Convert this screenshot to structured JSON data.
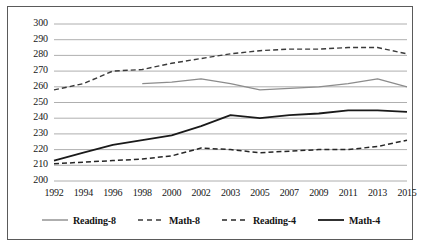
{
  "chart_data": {
    "type": "line",
    "title": "",
    "xlabel": "",
    "ylabel": "",
    "grid": true,
    "legend_position": "bottom",
    "ylim": [
      200,
      300
    ],
    "ytick_step": 10,
    "yticks": [
      "200",
      "210",
      "220",
      "230",
      "240",
      "250",
      "260",
      "270",
      "280",
      "290",
      "300"
    ],
    "categories": [
      "1992",
      "1994",
      "1996",
      "1998",
      "2000",
      "2002",
      "2003",
      "2005",
      "2007",
      "2009",
      "2011",
      "2013",
      "2015"
    ],
    "series": [
      {
        "name": "Reading-8",
        "style": "solid",
        "color": "#8c8c8c",
        "width": 1.3,
        "values": [
          null,
          null,
          null,
          262,
          263,
          265,
          262,
          258,
          259,
          260,
          262,
          265,
          260
        ]
      },
      {
        "name": "Math-8",
        "style": "dashed",
        "color": "#3a3a3a",
        "width": 1.4,
        "values": [
          258,
          262,
          270,
          271,
          275,
          278,
          281,
          283,
          284,
          284,
          285,
          285,
          281
        ]
      },
      {
        "name": "Reading-4",
        "style": "dashed",
        "color": "#262626",
        "width": 1.5,
        "values": [
          211,
          212,
          213,
          214,
          216,
          221,
          220,
          218,
          219,
          220,
          220,
          222,
          226
        ]
      },
      {
        "name": "Math-4",
        "style": "solid",
        "color": "#1a1a1a",
        "width": 1.8,
        "values": [
          213,
          218,
          223,
          226,
          229,
          235,
          242,
          240,
          242,
          243,
          245,
          245,
          244
        ]
      }
    ]
  },
  "legend": {
    "items": [
      {
        "label": "Reading-8"
      },
      {
        "label": "Math-8"
      },
      {
        "label": "Reading-4"
      },
      {
        "label": "Math-4"
      }
    ]
  }
}
